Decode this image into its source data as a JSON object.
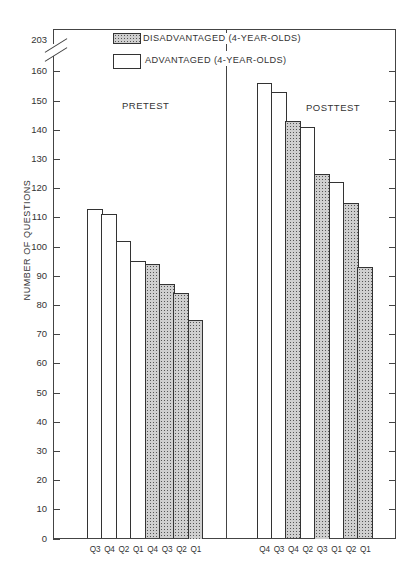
{
  "chart_data": {
    "type": "bar",
    "title": "",
    "xlabel": "",
    "ylabel": "NUMBER OF QUESTIONS",
    "ylim": [
      0,
      160
    ],
    "axis_break": {
      "label": "203",
      "note": "axis break between 160 and 203"
    },
    "yticks": [
      0,
      10,
      20,
      30,
      40,
      50,
      60,
      70,
      80,
      90,
      100,
      110,
      120,
      130,
      140,
      150,
      160
    ],
    "grid": false,
    "legend": {
      "position": "top-center",
      "entries": [
        {
          "label": "DISADVANTAGED (4-YEAR-OLDS)",
          "style": "stippled"
        },
        {
          "label": "ADVANTAGED (4-YEAR-OLDS)",
          "style": "open"
        }
      ]
    },
    "panels": [
      {
        "label": "PRETEST",
        "bars": [
          {
            "category": "Q3",
            "group": "ADVANTAGED",
            "value": 113
          },
          {
            "category": "Q4",
            "group": "ADVANTAGED",
            "value": 111
          },
          {
            "category": "Q2",
            "group": "ADVANTAGED",
            "value": 102
          },
          {
            "category": "Q1",
            "group": "ADVANTAGED",
            "value": 95
          },
          {
            "category": "Q4",
            "group": "DISADVANTAGED",
            "value": 94
          },
          {
            "category": "Q3",
            "group": "DISADVANTAGED",
            "value": 87
          },
          {
            "category": "Q2",
            "group": "DISADVANTAGED",
            "value": 84
          },
          {
            "category": "Q1",
            "group": "DISADVANTAGED",
            "value": 75
          }
        ]
      },
      {
        "label": "POSTTEST",
        "bars": [
          {
            "category": "Q4",
            "group": "ADVANTAGED",
            "value": 156
          },
          {
            "category": "Q3",
            "group": "ADVANTAGED",
            "value": 153
          },
          {
            "category": "Q4",
            "group": "DISADVANTAGED",
            "value": 143
          },
          {
            "category": "Q2",
            "group": "ADVANTAGED",
            "value": 141
          },
          {
            "category": "Q3",
            "group": "DISADVANTAGED",
            "value": 125
          },
          {
            "category": "Q1",
            "group": "ADVANTAGED",
            "value": 122
          },
          {
            "category": "Q2",
            "group": "DISADVANTAGED",
            "value": 115
          },
          {
            "category": "Q1",
            "group": "DISADVANTAGED",
            "value": 93
          }
        ]
      }
    ]
  },
  "labels": {
    "ylabel": "NUMBER OF QUESTIONS",
    "pretest": "PRETEST",
    "posttest": "POSTTEST",
    "break_value": "203",
    "legend_dis": "DISADVANTAGED (4-YEAR-OLDS)",
    "legend_adv": "ADVANTAGED (4-YEAR-OLDS)"
  },
  "colors": {
    "axis": "#444444",
    "advantaged_fill": "#ffffff",
    "disadvantaged_fill": "#cfcfcf"
  }
}
